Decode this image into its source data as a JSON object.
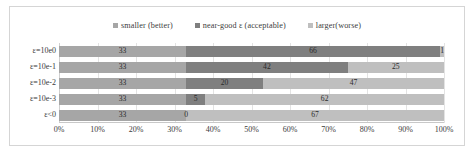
{
  "chart_data": {
    "type": "bar",
    "orientation": "horizontal",
    "stacked": true,
    "stack_mode": "percent",
    "title": "",
    "subtitle": "",
    "xlabel": "",
    "ylabel": "",
    "xlim": [
      0,
      100
    ],
    "xticks": [
      "0%",
      "10%",
      "20%",
      "30%",
      "40%",
      "50%",
      "60%",
      "70%",
      "80%",
      "90%",
      "100%"
    ],
    "xtick_values": [
      0,
      10,
      20,
      30,
      40,
      50,
      60,
      70,
      80,
      90,
      100
    ],
    "grid": true,
    "grid_axis": "x",
    "legend_position": "top-center",
    "categories": [
      "ε=10e0",
      "ε=10e-1",
      "ε=10e-2",
      "ε=10e-3",
      "ε<0"
    ],
    "series": [
      {
        "name": "smaller (better)",
        "color": "#a6a6a6",
        "values": [
          33,
          33,
          33,
          33,
          33
        ]
      },
      {
        "name": "near-good ε (acceptable)",
        "color": "#7f7f7f",
        "values": [
          66,
          42,
          20,
          5,
          0
        ]
      },
      {
        "name": "larger(worse)",
        "color": "#bfbfbf",
        "values": [
          1,
          25,
          47,
          62,
          67
        ]
      }
    ],
    "data_labels": [
      [
        "33",
        "66",
        "1"
      ],
      [
        "33",
        "42",
        "25"
      ],
      [
        "33",
        "20",
        "47"
      ],
      [
        "33",
        "5",
        "62"
      ],
      [
        "33",
        "0",
        "67"
      ]
    ]
  },
  "legend": {
    "items": [
      {
        "label": "smaller (better)",
        "color": "#a6a6a6"
      },
      {
        "label": "near-good ε (acceptable)",
        "color": "#7f7f7f"
      },
      {
        "label": "larger(worse)",
        "color": "#bfbfbf"
      }
    ]
  }
}
